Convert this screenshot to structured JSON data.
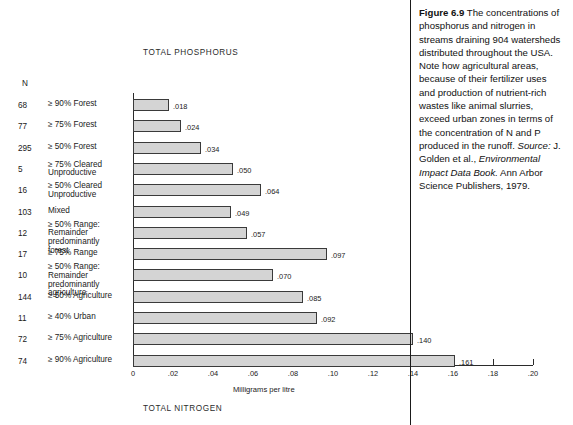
{
  "figure": {
    "chart_title": "TOTAL PHOSPHORUS",
    "bottom_title": "TOTAL NITROGEN",
    "n_header": "N",
    "x_axis_label": "Milligrams per litre"
  },
  "caption": {
    "figure_number": "Figure 6.9",
    "body": " The concentrations of phosphorus and nitrogen in streams draining 904 watersheds distributed throughout the USA. Note how agricultural areas, because of their fertilizer uses and production of nutrient-rich wastes like animal slurries, exceed urban zones in terms of the concentration of N and P produced in the runoff.",
    "source_label": "Source:",
    "source_pre": " J. Golden et al., ",
    "source_italic": "Environmental Impact Data Book.",
    "source_post": " Ann Arbor Science Publishers, 1979."
  },
  "chart_data": {
    "type": "bar",
    "orientation": "horizontal",
    "title": "TOTAL PHOSPHORUS",
    "xlabel": "Milligrams per litre",
    "ylabel": "",
    "xlim": [
      0,
      0.2
    ],
    "grid": false,
    "legend": null,
    "tick_labels": [
      "0",
      ".02",
      ".04",
      ".06",
      ".08",
      ".10",
      ".12",
      ".14",
      ".16",
      ".18",
      ".20"
    ],
    "tick_values": [
      0,
      0.02,
      0.04,
      0.06,
      0.08,
      0.1,
      0.12,
      0.14,
      0.16,
      0.18,
      0.2
    ],
    "n_column_header": "N",
    "categories": [
      {
        "n": "68",
        "label_lines": [
          "≥ 90% Forest"
        ]
      },
      {
        "n": "77",
        "label_lines": [
          "≥ 75% Forest"
        ]
      },
      {
        "n": "295",
        "label_lines": [
          "≥ 50% Forest"
        ]
      },
      {
        "n": "5",
        "label_lines": [
          "≥ 75% Cleared",
          "Unproductive"
        ]
      },
      {
        "n": "16",
        "label_lines": [
          "≥ 50% Cleared",
          "Unproductive"
        ]
      },
      {
        "n": "103",
        "label_lines": [
          "Mixed"
        ]
      },
      {
        "n": "12",
        "label_lines": [
          "≥ 50% Range:",
          "Remainder predominantly",
          "forest"
        ]
      },
      {
        "n": "17",
        "label_lines": [
          "≥ 75% Range"
        ]
      },
      {
        "n": "10",
        "label_lines": [
          "≥ 50% Range:",
          "Remainder predominantly",
          "agriculture"
        ]
      },
      {
        "n": "144",
        "label_lines": [
          "≥ 50% Agriculture"
        ]
      },
      {
        "n": "11",
        "label_lines": [
          "≥ 40% Urban"
        ]
      },
      {
        "n": "72",
        "label_lines": [
          "≥ 75% Agriculture"
        ]
      },
      {
        "n": "74",
        "label_lines": [
          "≥ 90% Agriculture"
        ]
      }
    ],
    "values": [
      0.018,
      0.024,
      0.034,
      0.05,
      0.064,
      0.049,
      0.057,
      0.097,
      0.07,
      0.085,
      0.092,
      0.14,
      0.161
    ],
    "value_labels": [
      ".018",
      ".024",
      ".034",
      ".050",
      ".064",
      ".049",
      ".057",
      ".097",
      ".070",
      ".085",
      ".092",
      ".140",
      ".161"
    ]
  },
  "colors": {
    "bar_fill": "#d4d4d4",
    "bar_stroke": "#3a3a3a",
    "axis": "#2b2b2b",
    "text": "#1a1a1a",
    "background": "#ffffff"
  }
}
